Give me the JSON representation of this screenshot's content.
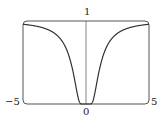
{
  "chart_data": {
    "type": "line",
    "title": "",
    "xlabel": "",
    "ylabel": "",
    "function": "y = e^(-1/x^2)",
    "xlim": [
      -5,
      5
    ],
    "ylim": [
      0,
      1
    ],
    "grid": false,
    "legend": null,
    "tick_labels": {
      "x_min": "−5",
      "x_zero": "0",
      "x_max": "5",
      "y_max": "1"
    },
    "series": [
      {
        "name": "f(x)",
        "x": [
          -5,
          -4,
          -3,
          -2,
          -1.5,
          -1,
          -0.75,
          -0.5,
          -0.4,
          -0.3,
          0,
          0.3,
          0.4,
          0.5,
          0.75,
          1,
          1.5,
          2,
          3,
          4,
          5
        ],
        "values": [
          0.961,
          0.939,
          0.895,
          0.779,
          0.641,
          0.368,
          0.169,
          0.018,
          0.002,
          0.0,
          0.0,
          0.0,
          0.002,
          0.018,
          0.169,
          0.368,
          0.641,
          0.779,
          0.895,
          0.939,
          0.961
        ]
      }
    ],
    "colors": {
      "curve": "#333333",
      "axes": "#555555",
      "frame": "#555555"
    }
  }
}
